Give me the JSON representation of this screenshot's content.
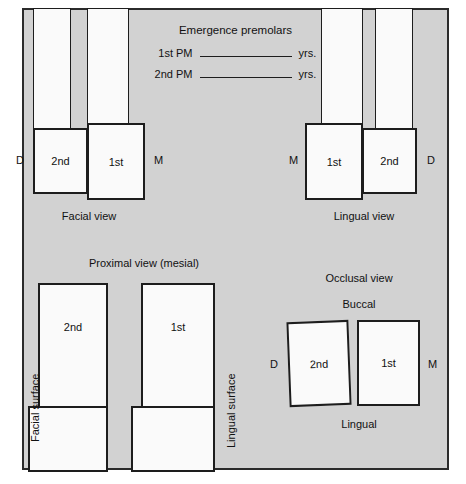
{
  "worksheet": {
    "title": "Premolars anatomy worksheet",
    "background_color": "#d2d2d2",
    "border_color": "#2b2b2b",
    "tooth_fill": "#fafafa"
  },
  "emergence": {
    "title": "Emergence premolars",
    "rows": [
      {
        "label": "1st PM",
        "value": "",
        "unit": "yrs."
      },
      {
        "label": "2nd PM",
        "value": "",
        "unit": "yrs."
      }
    ]
  },
  "facial_view": {
    "caption": "Facial view",
    "left_marker": "D",
    "right_marker": "M",
    "teeth": [
      {
        "name": "2nd",
        "label": "2nd"
      },
      {
        "name": "1st",
        "label": "1st"
      }
    ]
  },
  "lingual_view": {
    "caption": "Lingual view",
    "left_marker": "M",
    "right_marker": "D",
    "teeth": [
      {
        "name": "1st",
        "label": "1st"
      },
      {
        "name": "2nd",
        "label": "2nd"
      }
    ]
  },
  "proximal_view": {
    "caption": "Proximal view (mesial)",
    "left_surface": "Facial surface",
    "right_surface": "Lingual surface",
    "teeth": [
      {
        "name": "2nd",
        "label": "2nd"
      },
      {
        "name": "1st",
        "label": "1st"
      }
    ]
  },
  "occlusal_view": {
    "caption": "Occlusal view",
    "top_marker": "Buccal",
    "bottom_marker": "Lingual",
    "left_marker": "D",
    "right_marker": "M",
    "teeth": [
      {
        "name": "2nd",
        "label": "2nd"
      },
      {
        "name": "1st",
        "label": "1st"
      }
    ]
  }
}
